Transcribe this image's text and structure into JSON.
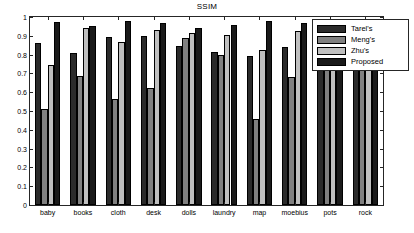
{
  "chart_data": {
    "type": "bar",
    "title": "SSIM",
    "xlabel": "",
    "ylabel": "",
    "ylim": [
      0,
      1
    ],
    "ytick_labels": [
      "0",
      "0.1",
      "0.2",
      "0.3",
      "0.4",
      "0.5",
      "0.6",
      "0.7",
      "0.8",
      "0.9",
      "1"
    ],
    "ytick_values": [
      0,
      0.1,
      0.2,
      0.3,
      0.4,
      0.5,
      0.6,
      0.7,
      0.8,
      0.9,
      1.0
    ],
    "grid": false,
    "legend_position": "upper right",
    "categories": [
      "baby",
      "books",
      "cloth",
      "desk",
      "dolls",
      "laundry",
      "map",
      "moebius",
      "pots",
      "rock"
    ],
    "series": [
      {
        "name": "Tarel's",
        "color": "#2b2b2b",
        "values": [
          0.86,
          0.81,
          0.895,
          0.9,
          0.845,
          0.815,
          0.795,
          0.84,
          0.865,
          0.875
        ]
      },
      {
        "name": "Meng's",
        "color": "#808080",
        "values": [
          0.51,
          0.685,
          0.565,
          0.625,
          0.89,
          0.8,
          0.455,
          0.68,
          0.85,
          0.865
        ]
      },
      {
        "name": "Zhu's",
        "color": "#bfbfbf",
        "values": [
          0.745,
          0.94,
          0.865,
          0.93,
          0.915,
          0.905,
          0.825,
          0.925,
          0.89,
          0.885
        ]
      },
      {
        "name": "Proposed",
        "color": "#1a1a1a",
        "values": [
          0.975,
          0.95,
          0.98,
          0.97,
          0.94,
          0.955,
          0.98,
          0.97,
          0.925,
          0.955
        ]
      }
    ]
  }
}
